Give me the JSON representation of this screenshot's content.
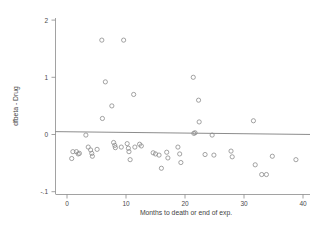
{
  "chart_data": {
    "type": "scatter",
    "title": "",
    "xlabel": "Months to death or end of exp.",
    "ylabel": "dfbeta - Drug",
    "xlim": [
      -1.5,
      41.5
    ],
    "ylim": [
      -0.115,
      0.225
    ],
    "grid": false,
    "legend": null,
    "xticks": [
      0,
      10,
      20,
      30,
      40
    ],
    "xticklabels": [
      "0",
      "10",
      "20",
      "30",
      "40"
    ],
    "yticks": [
      0.2,
      0.1,
      0.0,
      -0.1
    ],
    "yticklabels": [
      "2",
      "1",
      "0",
      "-.1"
    ],
    "reference_line": {
      "orientation": "horizontal",
      "y": 0.005,
      "slope": -0.00012
    },
    "marker": "open-circle",
    "points": [
      {
        "x": 0.8,
        "y": -0.042
      },
      {
        "x": 1.0,
        "y": -0.03
      },
      {
        "x": 1.6,
        "y": -0.03
      },
      {
        "x": 1.9,
        "y": -0.034
      },
      {
        "x": 2.1,
        "y": -0.033
      },
      {
        "x": 3.2,
        "y": -0.001
      },
      {
        "x": 3.6,
        "y": -0.022
      },
      {
        "x": 4.0,
        "y": -0.027
      },
      {
        "x": 4.2,
        "y": -0.033
      },
      {
        "x": 4.3,
        "y": -0.038
      },
      {
        "x": 5.1,
        "y": -0.026
      },
      {
        "x": 5.9,
        "y": 0.165
      },
      {
        "x": 6.0,
        "y": 0.028
      },
      {
        "x": 6.5,
        "y": 0.092
      },
      {
        "x": 7.6,
        "y": 0.05
      },
      {
        "x": 7.9,
        "y": -0.014
      },
      {
        "x": 8.1,
        "y": -0.019
      },
      {
        "x": 8.2,
        "y": -0.023
      },
      {
        "x": 9.2,
        "y": -0.022
      },
      {
        "x": 9.6,
        "y": 0.165
      },
      {
        "x": 10.2,
        "y": -0.016
      },
      {
        "x": 10.4,
        "y": -0.024
      },
      {
        "x": 10.5,
        "y": -0.03
      },
      {
        "x": 10.7,
        "y": -0.044
      },
      {
        "x": 11.3,
        "y": 0.07
      },
      {
        "x": 11.5,
        "y": -0.022
      },
      {
        "x": 12.3,
        "y": -0.017
      },
      {
        "x": 12.6,
        "y": -0.02
      },
      {
        "x": 14.6,
        "y": -0.032
      },
      {
        "x": 15.0,
        "y": -0.034
      },
      {
        "x": 15.6,
        "y": -0.036
      },
      {
        "x": 16.0,
        "y": -0.059
      },
      {
        "x": 16.9,
        "y": -0.031
      },
      {
        "x": 17.1,
        "y": -0.041
      },
      {
        "x": 18.8,
        "y": -0.022
      },
      {
        "x": 19.1,
        "y": -0.034
      },
      {
        "x": 19.3,
        "y": -0.049
      },
      {
        "x": 21.4,
        "y": 0.1
      },
      {
        "x": 21.5,
        "y": 0.002
      },
      {
        "x": 21.7,
        "y": 0.003
      },
      {
        "x": 22.3,
        "y": 0.06
      },
      {
        "x": 22.4,
        "y": 0.022
      },
      {
        "x": 23.4,
        "y": -0.035
      },
      {
        "x": 24.6,
        "y": -0.001
      },
      {
        "x": 24.9,
        "y": -0.036
      },
      {
        "x": 27.8,
        "y": -0.029
      },
      {
        "x": 28.0,
        "y": -0.039
      },
      {
        "x": 31.6,
        "y": 0.024
      },
      {
        "x": 31.9,
        "y": -0.053
      },
      {
        "x": 33.0,
        "y": -0.07
      },
      {
        "x": 33.8,
        "y": -0.07
      },
      {
        "x": 34.8,
        "y": -0.038
      },
      {
        "x": 38.8,
        "y": -0.044
      }
    ]
  }
}
